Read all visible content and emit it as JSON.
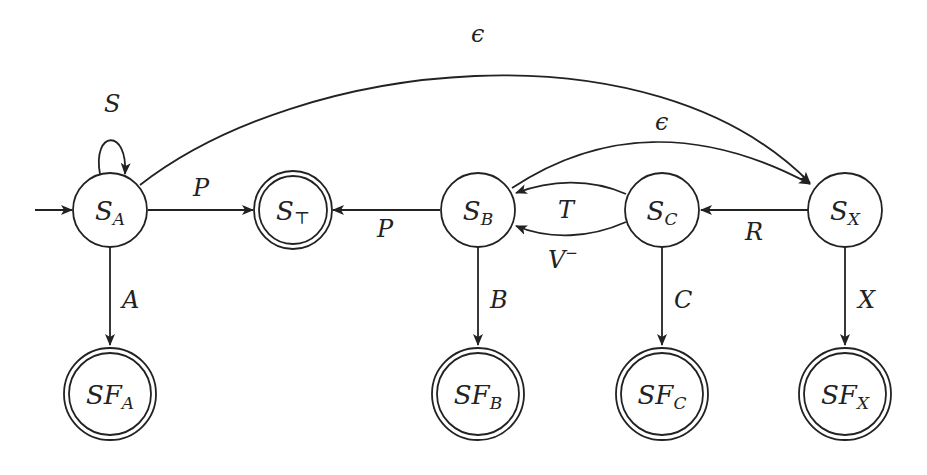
{
  "diagram": {
    "type": "state-machine",
    "states": [
      {
        "id": "SA",
        "base": "S",
        "sub": "A",
        "accepting": false,
        "initial": true
      },
      {
        "id": "ST",
        "base": "S",
        "sub": "⊤",
        "accepting": true,
        "initial": false
      },
      {
        "id": "SB",
        "base": "S",
        "sub": "B",
        "accepting": false,
        "initial": false
      },
      {
        "id": "SC",
        "base": "S",
        "sub": "C",
        "accepting": false,
        "initial": false
      },
      {
        "id": "SX",
        "base": "S",
        "sub": "X",
        "accepting": false,
        "initial": false
      },
      {
        "id": "SFA",
        "base": "SF",
        "sub": "A",
        "accepting": true,
        "initial": false
      },
      {
        "id": "SFB",
        "base": "SF",
        "sub": "B",
        "accepting": true,
        "initial": false
      },
      {
        "id": "SFC",
        "base": "SF",
        "sub": "C",
        "accepting": true,
        "initial": false
      },
      {
        "id": "SFX",
        "base": "SF",
        "sub": "X",
        "accepting": true,
        "initial": false
      }
    ],
    "edges": {
      "sa_self": {
        "from": "SA",
        "to": "SA",
        "label": "S"
      },
      "sa_st": {
        "from": "SA",
        "to": "ST",
        "label": "P"
      },
      "sa_sx": {
        "from": "SA",
        "to": "SX",
        "label": "ϵ"
      },
      "sa_sfa": {
        "from": "SA",
        "to": "SFA",
        "label": "A"
      },
      "sb_st": {
        "from": "SB",
        "to": "ST",
        "label": "P"
      },
      "sb_sx": {
        "from": "SB",
        "to": "SX",
        "label": "ϵ"
      },
      "sb_sfb": {
        "from": "SB",
        "to": "SFB",
        "label": "B"
      },
      "sc_sb_t": {
        "from": "SC",
        "to": "SB",
        "label": "T"
      },
      "sc_sb_v": {
        "from": "SC",
        "to": "SB",
        "label": "V",
        "sup": "−"
      },
      "sc_sfc": {
        "from": "SC",
        "to": "SFC",
        "label": "C"
      },
      "sx_sc": {
        "from": "SX",
        "to": "SC",
        "label": "R"
      },
      "sx_sfx": {
        "from": "SX",
        "to": "SFX",
        "label": "X"
      }
    }
  },
  "labels": {
    "SA": {
      "base": "S",
      "sub": "A"
    },
    "ST": {
      "base": "S",
      "sub": "⊤"
    },
    "SB": {
      "base": "S",
      "sub": "B"
    },
    "SC": {
      "base": "S",
      "sub": "C"
    },
    "SX": {
      "base": "S",
      "sub": "X"
    },
    "SFA": {
      "base": "SF",
      "sub": "A"
    },
    "SFB": {
      "base": "SF",
      "sub": "B"
    },
    "SFC": {
      "base": "SF",
      "sub": "C"
    },
    "SFX": {
      "base": "SF",
      "sub": "X"
    }
  },
  "colors": {
    "stroke": "#222222",
    "background": "#ffffff"
  }
}
